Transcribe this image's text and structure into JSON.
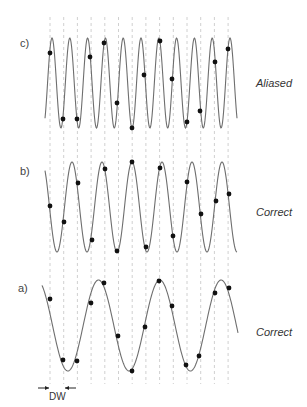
{
  "colors": {
    "curve": "#6e6e6e",
    "sample": "#111111",
    "grid": "#d0d0d0",
    "text": "#444444"
  },
  "grid": {
    "x_lines": [
      50,
      63.7,
      77.4,
      91.1,
      104.8,
      118.5,
      132.2,
      145.9,
      159.6,
      173.3,
      187,
      200.7,
      214.4,
      228.1
    ],
    "y_top": 17,
    "y_bottom": 384
  },
  "panels": [
    {
      "id": "c",
      "label": "c)",
      "status": "Aliased",
      "label_pos": [
        20,
        37
      ],
      "status_pos": [
        256,
        77
      ],
      "wave": {
        "x_start": 45,
        "x_end": 237,
        "y_top": 38,
        "y_bottom": 128,
        "period": 17.8,
        "first_peak_x": 52
      },
      "samples": [
        [
          50,
          53
        ],
        [
          63,
          119
        ],
        [
          77,
          119
        ],
        [
          90,
          57
        ],
        [
          104,
          43
        ],
        [
          117,
          103
        ],
        [
          132,
          128
        ],
        [
          144,
          75
        ],
        [
          160,
          41
        ],
        [
          172,
          79
        ],
        [
          187,
          122
        ],
        [
          200,
          111
        ],
        [
          215,
          62
        ],
        [
          228,
          49
        ]
      ]
    },
    {
      "id": "b",
      "label": "b)",
      "status": "Correct",
      "label_pos": [
        20,
        165
      ],
      "status_pos": [
        256,
        206
      ],
      "wave": {
        "x_start": 45,
        "x_end": 237,
        "y_top": 162,
        "y_bottom": 252,
        "period": 30,
        "first_peak_x": 72
      },
      "samples": [
        [
          50,
          206
        ],
        [
          64,
          222
        ],
        [
          78,
          183
        ],
        [
          92,
          240
        ],
        [
          105,
          169
        ],
        [
          117,
          251
        ],
        [
          132,
          162
        ],
        [
          146,
          247
        ],
        [
          160,
          168
        ],
        [
          173,
          236
        ],
        [
          187,
          182
        ],
        [
          201,
          214
        ],
        [
          216,
          201
        ],
        [
          229,
          194
        ]
      ]
    },
    {
      "id": "a",
      "label": "a)",
      "status": "Correct",
      "label_pos": [
        18,
        282
      ],
      "status_pos": [
        256,
        326
      ],
      "wave": {
        "x_start": 42,
        "x_end": 238,
        "y_top": 280,
        "y_bottom": 371,
        "period": 61.3,
        "first_peak_x": 98.5
      },
      "samples": [
        [
          50,
          299
        ],
        [
          63,
          360
        ],
        [
          77,
          361
        ],
        [
          91,
          303
        ],
        [
          104,
          283
        ],
        [
          118,
          336
        ],
        [
          132,
          371
        ],
        [
          145,
          327
        ],
        [
          159,
          281
        ],
        [
          172,
          306
        ],
        [
          186,
          365
        ],
        [
          199,
          356
        ],
        [
          215,
          293
        ],
        [
          229,
          288
        ]
      ]
    }
  ],
  "dwell": {
    "label": "DW",
    "arrow_y": 388,
    "left_arrow": [
      38,
      49
    ],
    "right_arrow": [
      76,
      65
    ],
    "label_pos": [
      49,
      391
    ]
  }
}
